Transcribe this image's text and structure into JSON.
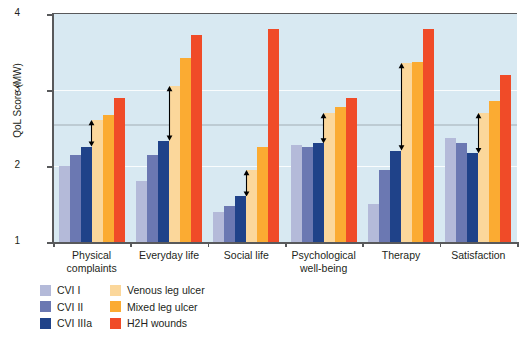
{
  "chart_data": {
    "type": "bar",
    "title": "",
    "xlabel": "",
    "ylabel": "QoL Score (MW)",
    "ylim": [
      1,
      4
    ],
    "yticks": [
      "1",
      "2",
      "3",
      "4"
    ],
    "grid": true,
    "legend_position": "bottom-left",
    "categories": [
      "Physical complaints",
      "Everyday life",
      "Social life",
      "Psychological well-being",
      "Therapy",
      "Satisfaction"
    ],
    "category_lines": [
      [
        "Physical",
        "complaints"
      ],
      [
        "Everyday life"
      ],
      [
        "Social life"
      ],
      [
        "Psychological",
        "well-being"
      ],
      [
        "Therapy"
      ],
      [
        "Satisfaction"
      ]
    ],
    "series": [
      {
        "name": "CVI I",
        "color": "#b4bad9",
        "values": [
          2.0,
          1.8,
          1.4,
          2.27,
          1.5,
          2.37
        ]
      },
      {
        "name": "CVI II",
        "color": "#6b78b2",
        "values": [
          2.15,
          2.15,
          1.48,
          2.25,
          1.95,
          2.3
        ]
      },
      {
        "name": "CVI IIIa",
        "color": "#1f4289",
        "values": [
          2.25,
          2.33,
          1.6,
          2.3,
          2.2,
          2.17
        ]
      },
      {
        "name": "Venous leg ulcer",
        "color": "#fbd79b",
        "values": [
          2.6,
          3.05,
          1.95,
          2.7,
          3.35,
          2.7
        ]
      },
      {
        "name": "Mixed leg ulcer",
        "color": "#fbab32",
        "values": [
          2.67,
          3.42,
          2.25,
          2.78,
          3.37,
          2.85
        ]
      },
      {
        "name": "H2H wounds",
        "color": "#f04b28",
        "values": [
          2.9,
          3.72,
          3.8,
          2.9,
          3.8,
          3.2
        ]
      }
    ],
    "annotations": [
      {
        "type": "double-arrow",
        "group": 0,
        "from": 2.25,
        "to": 2.6
      },
      {
        "type": "double-arrow",
        "group": 1,
        "from": 2.33,
        "to": 3.05
      },
      {
        "type": "double-arrow",
        "group": 2,
        "from": 1.6,
        "to": 1.95
      },
      {
        "type": "double-arrow",
        "group": 3,
        "from": 2.3,
        "to": 2.7
      },
      {
        "type": "double-arrow",
        "group": 4,
        "from": 2.2,
        "to": 3.35
      },
      {
        "type": "double-arrow",
        "group": 5,
        "from": 2.17,
        "to": 2.7
      }
    ],
    "reference_band": 2.55,
    "background_color": "#d8e9f2"
  },
  "legend": {
    "column_1": [
      {
        "label": "CVI I",
        "color": "#b4bad9"
      },
      {
        "label": "CVI II",
        "color": "#6b78b2"
      },
      {
        "label": "CVI IIIa",
        "color": "#1f4289"
      }
    ],
    "column_2": [
      {
        "label": "Venous leg ulcer",
        "color": "#fbd79b"
      },
      {
        "label": "Mixed leg ulcer",
        "color": "#fbab32"
      },
      {
        "label": "H2H wounds",
        "color": "#f04b28"
      }
    ]
  }
}
